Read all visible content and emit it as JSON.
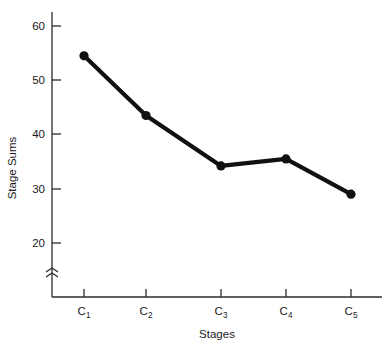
{
  "chart_data": {
    "type": "line",
    "title": "",
    "xlabel": "Stages",
    "ylabel": "Stage Sums",
    "categories": [
      "C1",
      "C2",
      "C3",
      "C4",
      "C5"
    ],
    "category_labels": [
      {
        "base": "C",
        "sub": "1"
      },
      {
        "base": "C",
        "sub": "2"
      },
      {
        "base": "C",
        "sub": "3"
      },
      {
        "base": "C",
        "sub": "4"
      },
      {
        "base": "C",
        "sub": "5"
      }
    ],
    "values": [
      54.5,
      43.5,
      34.2,
      35.5,
      29.0
    ],
    "ylim": [
      18,
      62
    ],
    "yticks": [
      20,
      30,
      40,
      50,
      60
    ],
    "ytick_labels": [
      "20",
      "30",
      "40",
      "50",
      "60"
    ],
    "grid": false,
    "legend": "none",
    "axis_break": {
      "axis": "y",
      "symbol": "zigzag",
      "note": "y-axis broken below 20"
    },
    "marker": "filled-circle",
    "line_color": "#111111",
    "marker_color": "#111111",
    "axis_color": "#2b2b2b",
    "background": "#ffffff"
  }
}
